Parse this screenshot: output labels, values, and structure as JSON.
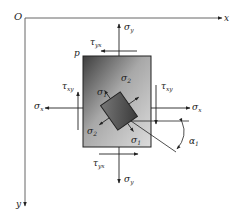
{
  "diagram": {
    "type": "plane-stress-element",
    "axes": {
      "origin_label": "O",
      "x_label": "x",
      "y_label": "y"
    },
    "point_label": "p",
    "stresses": {
      "sigma": "σ",
      "tau": "τ",
      "top": {
        "normal": {
          "sym": "σ",
          "sub": "y"
        },
        "shear": {
          "sym": "τ",
          "sub": "yx"
        }
      },
      "bottom": {
        "normal": {
          "sym": "σ",
          "sub": "y"
        },
        "shear": {
          "sym": "τ",
          "sub": "yx"
        }
      },
      "left": {
        "normal": {
          "sym": "σ",
          "sub": "x"
        },
        "shear": {
          "sym": "τ",
          "sub": "xy"
        }
      },
      "right": {
        "normal": {
          "sym": "σ",
          "sub": "x"
        },
        "shear": {
          "sym": "τ",
          "sub": "xy"
        }
      }
    },
    "principal": {
      "sigma1_a": {
        "sym": "σ",
        "sub": "1"
      },
      "sigma1_b": {
        "sym": "σ",
        "sub": "1"
      },
      "sigma2_a": {
        "sym": "σ",
        "sub": "2"
      },
      "sigma2_b": {
        "sym": "σ",
        "sub": "2"
      },
      "angle": {
        "sym": "α",
        "sub": "1"
      }
    },
    "colors": {
      "line": "#222222",
      "element_dark": "#4a4a4a",
      "element_light": "#d8d8d8",
      "inner_element": "#555555"
    }
  }
}
